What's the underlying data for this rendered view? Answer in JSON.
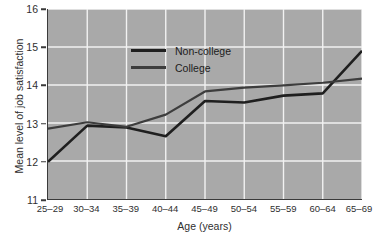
{
  "chart_data": {
    "type": "line",
    "title": "",
    "xlabel": "Age (years)",
    "ylabel": "Mean level of job satisfaction",
    "categories": [
      "25–29",
      "30–34",
      "35–39",
      "40–44",
      "45–49",
      "50–54",
      "55–59",
      "60–64",
      "65–69"
    ],
    "ylim": [
      11,
      16
    ],
    "yticks": [
      11,
      12,
      13,
      14,
      15,
      16
    ],
    "yticklabels": [
      "11",
      "12",
      "13",
      "14",
      "15",
      "16"
    ],
    "grid": true,
    "grid_color": "#f2f2f2",
    "plot_background": "#a9a9a9",
    "legend_position": "upper-left-inside",
    "series": [
      {
        "name": "Non-college",
        "color": "#1f1f1f",
        "line_width": 2.6,
        "values": [
          11.98,
          12.93,
          12.88,
          12.65,
          13.58,
          13.54,
          13.72,
          13.78,
          14.9
        ]
      },
      {
        "name": "College",
        "color": "#3d3d3d",
        "line_width": 2.2,
        "values": [
          12.85,
          13.02,
          12.9,
          13.22,
          13.83,
          13.93,
          13.99,
          14.06,
          14.17
        ]
      }
    ]
  },
  "legend": {
    "items": [
      {
        "label": "Non-college"
      },
      {
        "label": "College"
      }
    ]
  },
  "axes": {
    "y_title": "Mean level of job satisfaction",
    "x_title": "Age (years)"
  }
}
